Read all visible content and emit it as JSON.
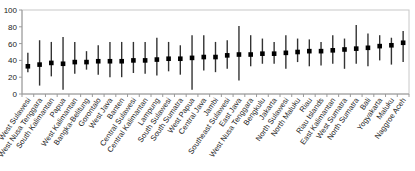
{
  "chart_data": {
    "type": "scatter",
    "subtype": "dot-with-range",
    "title": "",
    "xlabel": "",
    "ylabel": "",
    "ylim": [
      0,
      100
    ],
    "yticks": [
      0,
      20,
      40,
      60,
      80,
      100
    ],
    "grid": false,
    "legend": null,
    "categories": [
      "West Sulawesi",
      "West Nusa Tenggara",
      "South Kalimantan",
      "Papua",
      "West Kalimantan",
      "Bangka-Belitung",
      "Gorontalo",
      "West Java",
      "Banten",
      "Central Sulawesi",
      "Central Kalimantan",
      "Lampung",
      "South Sulawesi",
      "South Sumatra",
      "West Papua",
      "Central Java",
      "Jambi",
      "Southeast Sulawesi",
      "East Java",
      "West Nusa Tenggara",
      "Bengkulu",
      "Jakarta",
      "North Sulawesi",
      "North Maluku",
      "Riau",
      "Riau Islands",
      "East Kalimantan",
      "West Sumatra",
      "North Sumatra",
      "Bali",
      "Yogyakarta",
      "Maluku",
      "Naggroe Aceh"
    ],
    "series": [
      {
        "name": "value",
        "values": [
          33,
          35,
          37,
          36,
          38,
          38,
          39,
          39,
          39,
          40,
          40,
          41,
          42,
          42,
          43,
          44,
          44,
          46,
          47,
          47,
          48,
          48,
          49,
          50,
          51,
          51,
          52,
          53,
          54,
          55,
          57,
          58,
          61
        ]
      },
      {
        "name": "upper",
        "values": [
          49,
          64,
          62,
          68,
          62,
          51,
          58,
          62,
          62,
          62,
          62,
          67,
          62,
          58,
          70,
          70,
          62,
          64,
          81,
          70,
          66,
          62,
          70,
          66,
          65,
          62,
          70,
          66,
          82,
          72,
          70,
          67,
          75
        ]
      },
      {
        "name": "lower",
        "values": [
          26,
          10,
          21,
          5,
          24,
          29,
          23,
          20,
          20,
          25,
          24,
          22,
          27,
          23,
          5,
          28,
          26,
          30,
          16,
          33,
          36,
          36,
          30,
          38,
          33,
          34,
          36,
          30,
          36,
          33,
          40,
          35,
          38
        ]
      }
    ]
  }
}
